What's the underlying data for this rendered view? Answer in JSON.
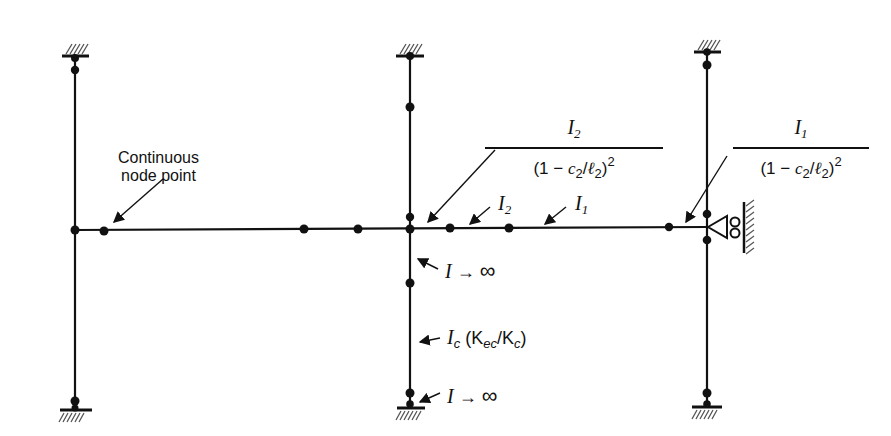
{
  "labels": {
    "continuous_node": [
      "Continuous",
      "node point"
    ],
    "frac_center": {
      "num": "I",
      "num_sub": "2",
      "den_pre": "(1 − ",
      "den_c": "c",
      "den_c_sub": "2",
      "den_slash": "/",
      "den_l": "ℓ",
      "den_l_sub": "2",
      "den_post": ")",
      "den_exp": "2"
    },
    "frac_right": {
      "num": "I",
      "num_sub": "1",
      "den_pre": "(1 − ",
      "den_c": "c",
      "den_c_sub": "2",
      "den_slash": "/",
      "den_l": "ℓ",
      "den_l_sub": "2",
      "den_post": ")",
      "den_exp": "2"
    },
    "i2": {
      "main": "I",
      "sub": "2"
    },
    "i1": {
      "main": "I",
      "sub": "1"
    },
    "i_inf_upper": {
      "main": "I",
      "arrow": " → ",
      "inf": "∞"
    },
    "ic": {
      "main": "I",
      "sub": "c",
      "paren": " (K",
      "k1sub": "ec",
      "slash": "/K",
      "k2sub": "c",
      "close": ")"
    },
    "i_inf_lower": {
      "main": "I",
      "arrow": " → ",
      "inf": "∞"
    }
  },
  "colors": {
    "ink": "#111111",
    "background": "#ffffff"
  }
}
